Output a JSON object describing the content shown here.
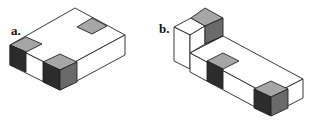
{
  "figure": {
    "panels": [
      {
        "id": "a",
        "label": "a.",
        "description": "Rectangular block with two shaded corner cubes and a shaded square on top"
      },
      {
        "id": "b",
        "label": "b.",
        "description": "L-shaped block with tall column at back-left, shaded cubes at top, middle and front"
      }
    ]
  },
  "colors": {
    "background": "#ffffff",
    "outline": "#222222",
    "top_shade": "#a6a6a6",
    "side_medium": "#6a6a6a",
    "side_dark": "#2c2c2c",
    "face_white": "#ffffff"
  }
}
